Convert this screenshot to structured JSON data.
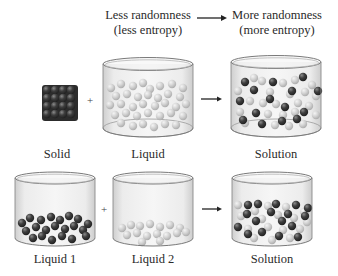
{
  "header": {
    "left_line1": "Less randomness",
    "left_line2": "(less entropy)",
    "right_line1": "More randomness",
    "right_line2": "(more entropy)"
  },
  "rows": [
    {
      "items": [
        {
          "label": "Solid",
          "type": "solid-cube",
          "particle": "dark"
        },
        {
          "label": "Liquid",
          "type": "beaker",
          "particle": "light"
        },
        {
          "label": "Solution",
          "type": "beaker",
          "particle": "mixed"
        }
      ],
      "operator": "+",
      "arrow": "→"
    },
    {
      "items": [
        {
          "label": "Liquid 1",
          "type": "beaker",
          "particle": "dark"
        },
        {
          "label": "Liquid 2",
          "type": "beaker",
          "particle": "light"
        },
        {
          "label": "Solution",
          "type": "beaker",
          "particle": "mixed"
        }
      ],
      "operator": "+",
      "arrow": "→"
    }
  ],
  "colors": {
    "dark_particle": "#3c3c3c",
    "light_particle": "#cfcfcf",
    "beaker_wall": "#e6e6e6",
    "beaker_edge": "#8a8a8a"
  }
}
